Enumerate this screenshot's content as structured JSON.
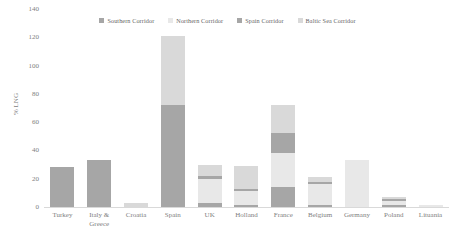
{
  "chart_data": {
    "type": "bar",
    "stacked": true,
    "title": "",
    "xlabel": "",
    "ylabel": "% LNG",
    "ylim": [
      0,
      140
    ],
    "yticks": [
      0,
      20,
      40,
      60,
      80,
      100,
      120,
      140
    ],
    "grid": false,
    "legend_position": "top",
    "categories": [
      "Turkey",
      "Italy &\nGreece",
      "Croatia",
      "Spain",
      "UK",
      "Holland",
      "France",
      "Belgium",
      "Germany",
      "Poland",
      "Lituania"
    ],
    "category_labels": [
      [
        "Turkey"
      ],
      [
        "Italy &",
        "Greece"
      ],
      [
        "Croatia"
      ],
      [
        "Spain"
      ],
      [
        "UK"
      ],
      [
        "Holland"
      ],
      [
        "France"
      ],
      [
        "Belgium"
      ],
      [
        "Germany"
      ],
      [
        "Poland"
      ],
      [
        "Lituania"
      ]
    ],
    "series": [
      {
        "name": "Southern Corridor",
        "color": "#a6a6a6",
        "values": [
          28.5,
          16.0,
          0,
          48.0,
          2.5,
          1.5,
          14.0,
          1.5,
          0,
          1.5,
          0
        ]
      },
      {
        "name": "Northern Corridor",
        "color": "#e8e8e8",
        "values": [
          0,
          0,
          0,
          0,
          17.5,
          9.5,
          24.0,
          14.5,
          33.5,
          2.5,
          1.5
        ]
      },
      {
        "name": "Spain Corridor",
        "color": "#a6a6a6",
        "values": [
          0,
          17.0,
          0,
          24.0,
          2.0,
          2.0,
          14.0,
          2.0,
          0,
          1.5,
          0
        ]
      },
      {
        "name": "Baltic Sea Corridor",
        "color": "#d9d9d9",
        "values": [
          0,
          0,
          3.0,
          49.0,
          8.0,
          16.0,
          20.0,
          3.5,
          0,
          1.5,
          0
        ]
      }
    ],
    "totals": [
      28.5,
      33.0,
      3.0,
      121.0,
      30.0,
      29.0,
      72.0,
      21.5,
      33.5,
      7.0,
      1.5
    ],
    "legend": [
      {
        "label": "Southern Corridor",
        "color": "#a6a6a6"
      },
      {
        "label": "Northern Corridor",
        "color": "#e8e8e8"
      },
      {
        "label": "Spain Corridor",
        "color": "#a6a6a6"
      },
      {
        "label": "Baltic Sea Corridor",
        "color": "#d9d9d9"
      }
    ],
    "colors": {
      "southern": "#a6a6a6",
      "northern": "#e8e8e8",
      "spain": "#a6a6a6",
      "baltic": "#d9d9d9",
      "axis": "#d9d9d9",
      "text": "#808080",
      "background": "#ffffff"
    }
  }
}
